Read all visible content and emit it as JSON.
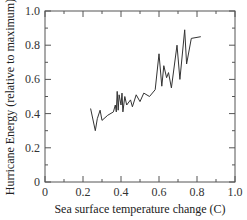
{
  "chart_data": {
    "type": "line",
    "title": "",
    "xlabel": "Sea surface temperature change (C)",
    "ylabel": "Hurricane Energy (relative to maximum)",
    "xlim": [
      0,
      1.0
    ],
    "ylim": [
      0,
      1.0
    ],
    "xticks": [
      "0",
      "0.2",
      "0.4",
      "0.6",
      "0.8",
      "1.0"
    ],
    "yticks": [
      "0",
      "0.2",
      "0.4",
      "0.6",
      "0.8",
      "1.0"
    ],
    "grid": false,
    "legend": null,
    "series": [
      {
        "name": "Hurricane Energy",
        "color": "#333333",
        "points": [
          [
            0.24,
            0.43
          ],
          [
            0.265,
            0.3
          ],
          [
            0.275,
            0.37
          ],
          [
            0.29,
            0.42
          ],
          [
            0.3,
            0.36
          ],
          [
            0.33,
            0.39
          ],
          [
            0.36,
            0.41
          ],
          [
            0.37,
            0.45
          ],
          [
            0.375,
            0.41
          ],
          [
            0.38,
            0.53
          ],
          [
            0.385,
            0.42
          ],
          [
            0.39,
            0.51
          ],
          [
            0.4,
            0.45
          ],
          [
            0.405,
            0.52
          ],
          [
            0.41,
            0.41
          ],
          [
            0.42,
            0.5
          ],
          [
            0.43,
            0.45
          ],
          [
            0.45,
            0.48
          ],
          [
            0.46,
            0.44
          ],
          [
            0.48,
            0.51
          ],
          [
            0.5,
            0.47
          ],
          [
            0.52,
            0.52
          ],
          [
            0.55,
            0.5
          ],
          [
            0.58,
            0.54
          ],
          [
            0.6,
            0.75
          ],
          [
            0.615,
            0.56
          ],
          [
            0.625,
            0.68
          ],
          [
            0.64,
            0.61
          ],
          [
            0.65,
            0.64
          ],
          [
            0.665,
            0.55
          ],
          [
            0.695,
            0.8
          ],
          [
            0.71,
            0.6
          ],
          [
            0.735,
            0.89
          ],
          [
            0.745,
            0.69
          ],
          [
            0.77,
            0.84
          ],
          [
            0.82,
            0.85
          ]
        ]
      }
    ]
  }
}
